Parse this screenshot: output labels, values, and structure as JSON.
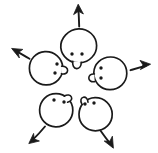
{
  "illustration": {
    "title": "Five round faces radiating outward with arrows",
    "style": "hand-drawn black ink line sketch on white",
    "background_color": "#ffffff",
    "ink_color": "#1a1a1a",
    "canvas": {
      "width": 158,
      "height": 153
    },
    "subject_count": 5,
    "arrow_count": 5
  },
  "faces": [
    {
      "id": "face-top",
      "label": "top face",
      "center": {
        "x": 78,
        "y": 46
      },
      "radius": 17,
      "facing": "down",
      "eyes": [
        {
          "x": 72,
          "y": 54
        },
        {
          "x": 82,
          "y": 54
        }
      ],
      "nose": {
        "x": 77,
        "y": 63
      }
    },
    {
      "id": "face-left",
      "label": "upper-left face",
      "center": {
        "x": 46,
        "y": 68
      },
      "radius": 16,
      "facing": "right",
      "eyes": [
        {
          "x": 57,
          "y": 64
        },
        {
          "x": 55,
          "y": 73
        }
      ],
      "nose": {
        "x": 62,
        "y": 70
      }
    },
    {
      "id": "face-right",
      "label": "upper-right face",
      "center": {
        "x": 110,
        "y": 73
      },
      "radius": 16,
      "facing": "left",
      "eyes": [
        {
          "x": 101,
          "y": 68
        },
        {
          "x": 101,
          "y": 78
        }
      ],
      "nose": {
        "x": 95,
        "y": 78
      }
    },
    {
      "id": "face-bottom-left",
      "label": "lower-left face",
      "center": {
        "x": 56,
        "y": 110
      },
      "radius": 16,
      "facing": "up",
      "eyes": [
        {
          "x": 54,
          "y": 100
        },
        {
          "x": 64,
          "y": 102
        }
      ],
      "nose": {
        "x": 65,
        "y": 96
      }
    },
    {
      "id": "face-bottom-right",
      "label": "lower-right face",
      "center": {
        "x": 95,
        "y": 114
      },
      "radius": 16,
      "facing": "up-left",
      "eyes": [
        {
          "x": 85,
          "y": 104
        },
        {
          "x": 94,
          "y": 103
        }
      ],
      "nose": {
        "x": 84,
        "y": 98
      }
    }
  ],
  "arrows": [
    {
      "id": "arrow-up",
      "label": "up arrow",
      "direction": "up",
      "from": {
        "x": 79,
        "y": 25
      },
      "to": {
        "x": 78,
        "y": 5
      }
    },
    {
      "id": "arrow-upper-left",
      "label": "upper-left arrow",
      "direction": "up-left",
      "from": {
        "x": 28,
        "y": 58
      },
      "to": {
        "x": 12,
        "y": 48
      }
    },
    {
      "id": "arrow-right",
      "label": "right arrow",
      "direction": "right",
      "from": {
        "x": 131,
        "y": 70
      },
      "to": {
        "x": 150,
        "y": 64
      }
    },
    {
      "id": "arrow-lower-left",
      "label": "lower-left arrow",
      "direction": "down-left",
      "from": {
        "x": 44,
        "y": 127
      },
      "to": {
        "x": 30,
        "y": 143
      }
    },
    {
      "id": "arrow-lower-right",
      "label": "lower-right arrow",
      "direction": "down-right",
      "from": {
        "x": 101,
        "y": 131
      },
      "to": {
        "x": 112,
        "y": 148
      }
    }
  ]
}
